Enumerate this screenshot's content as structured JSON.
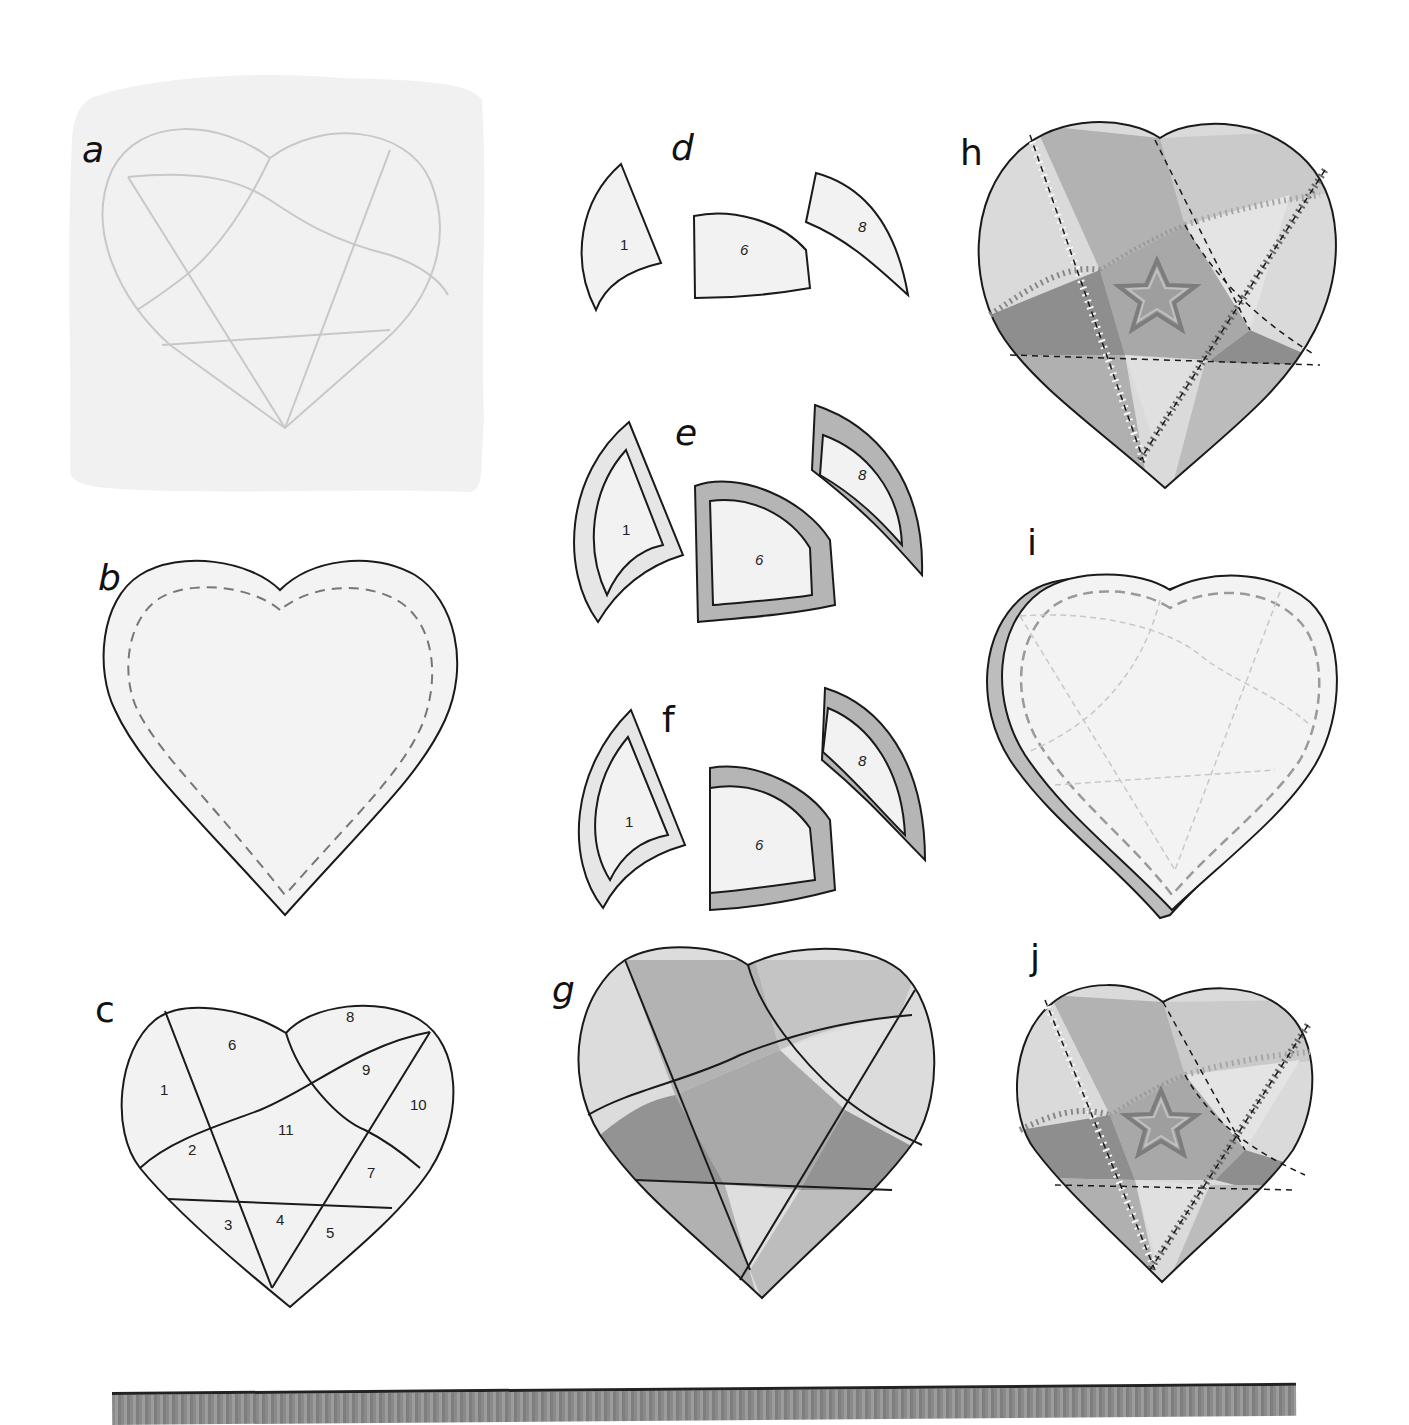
{
  "panels": {
    "a": {
      "label": "a",
      "description": "Heart pattern lines traced on fabric"
    },
    "b": {
      "label": "b",
      "description": "Heart backing with dashed seam line"
    },
    "c": {
      "label": "c",
      "description": "Pattern divided into numbered pieces",
      "pieces": [
        "1",
        "2",
        "3",
        "4",
        "5",
        "6",
        "7",
        "8",
        "9",
        "10",
        "11"
      ]
    },
    "d": {
      "label": "d",
      "pieces": [
        "1",
        "6",
        "8"
      ]
    },
    "e": {
      "label": "e",
      "pieces": [
        "1",
        "6",
        "8"
      ]
    },
    "f": {
      "label": "f",
      "pieces": [
        "1",
        "6",
        "8"
      ]
    },
    "g": {
      "label": "g",
      "description": "Fabric pieces assembled"
    },
    "h": {
      "label": "h",
      "description": "Embroidered seams with star motif"
    },
    "i": {
      "label": "i",
      "description": "Layered heart with quilting lines"
    },
    "j": {
      "label": "j",
      "description": "Finished embroidered heart"
    }
  },
  "colors": {
    "outline": "#1a1a1a",
    "fabric_light": "#e6e6e6",
    "fabric_mid": "#bdbdbd",
    "fabric_dark": "#9a9a9a",
    "fabric_darker": "#8a8a8a",
    "panel_a_bg": "#f1f1f1",
    "trace_line": "#c8c8c8"
  }
}
